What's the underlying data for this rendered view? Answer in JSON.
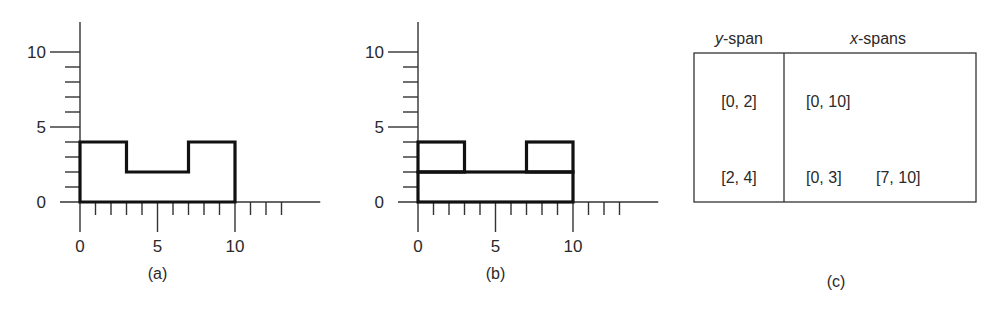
{
  "chart_data": [
    {
      "type": "diagram",
      "panel": "a",
      "caption": "(a)",
      "x_range": [
        0,
        14
      ],
      "y_range": [
        0,
        12
      ],
      "x_tick_labels": [
        "0",
        "5",
        "10"
      ],
      "y_tick_labels": [
        "0",
        "5",
        "10"
      ],
      "outline": [
        [
          0,
          0
        ],
        [
          0,
          4
        ],
        [
          3,
          4
        ],
        [
          3,
          2
        ],
        [
          7,
          2
        ],
        [
          7,
          4
        ],
        [
          10,
          4
        ],
        [
          10,
          0
        ],
        [
          0,
          0
        ]
      ]
    },
    {
      "type": "diagram",
      "panel": "b",
      "caption": "(b)",
      "x_range": [
        0,
        14
      ],
      "y_range": [
        0,
        12
      ],
      "x_tick_labels": [
        "0",
        "5",
        "10"
      ],
      "y_tick_labels": [
        "0",
        "5",
        "10"
      ],
      "rectangles": [
        {
          "x": [
            0,
            10
          ],
          "y": [
            0,
            2
          ]
        },
        {
          "x": [
            0,
            3
          ],
          "y": [
            2,
            4
          ]
        },
        {
          "x": [
            7,
            10
          ],
          "y": [
            2,
            4
          ]
        }
      ]
    },
    {
      "type": "table",
      "panel": "c",
      "caption": "(c)",
      "headers": {
        "y_italic": "y",
        "y_rest": "-span",
        "x_italic": "x",
        "x_rest": "-spans"
      },
      "rows": [
        {
          "y_span": "[0, 2]",
          "x_spans": [
            "[0, 10]"
          ]
        },
        {
          "y_span": "[2, 4]",
          "x_spans": [
            "[0, 3]",
            "[7, 10]"
          ]
        }
      ]
    }
  ]
}
